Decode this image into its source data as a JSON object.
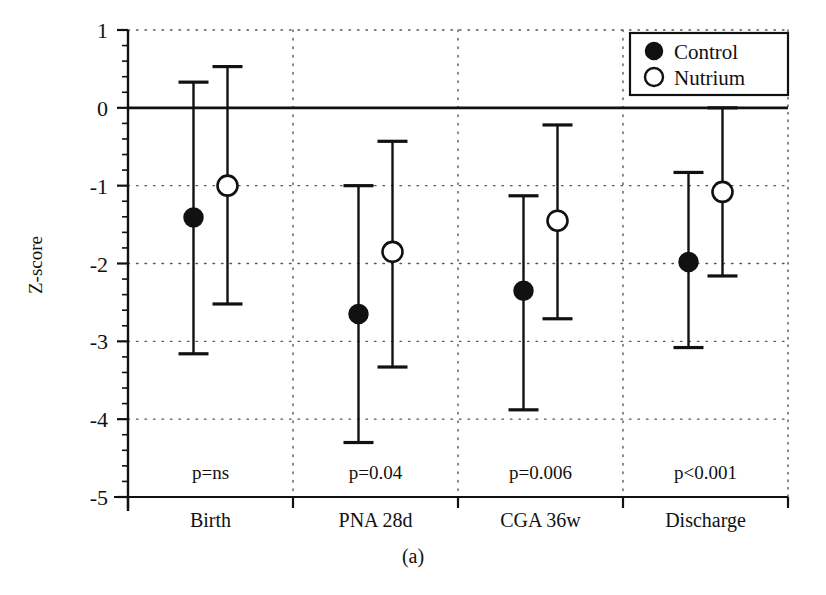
{
  "figure": {
    "caption": "(a)",
    "ylabel": "Z-score"
  },
  "legend": {
    "items": [
      {
        "label": "Control",
        "marker": "filled-circle-icon",
        "color": "#111111"
      },
      {
        "label": "Nutrium",
        "marker": "open-circle-icon",
        "color": "#111111"
      }
    ]
  },
  "axis": {
    "y_ticks": [
      "1",
      "0",
      "-1",
      "-2",
      "-3",
      "-4",
      "-5"
    ],
    "x_ticks": [
      "Birth",
      "PNA 28d",
      "CGA 36w",
      "Discharge"
    ]
  },
  "pvalues": [
    "p=ns",
    "p=0.04",
    "p=0.006",
    "p<0.001"
  ],
  "chart_data": {
    "type": "scatter",
    "title": "",
    "subtitle": "",
    "xlabel": "",
    "ylabel": "Z-score",
    "ylim": [
      -5,
      1
    ],
    "yticks": [
      1,
      0,
      -1,
      -2,
      -3,
      -4,
      -5
    ],
    "grid": true,
    "grid_style": "dotted",
    "legend_position": "top-right",
    "annotations": [
      "p=ns",
      "p=0.04",
      "p=0.006",
      "p<0.001",
      "(a)"
    ],
    "categories": [
      "Birth",
      "PNA 28d",
      "CGA 36w",
      "Discharge"
    ],
    "series": [
      {
        "name": "Control",
        "marker": "filled-circle",
        "values": [
          -1.41,
          -2.65,
          -2.35,
          -1.98
        ],
        "error_low": [
          -3.16,
          -4.3,
          -3.88,
          -3.08
        ],
        "error_high": [
          0.33,
          -1.0,
          -1.13,
          -0.83
        ]
      },
      {
        "name": "Nutrium",
        "marker": "open-circle",
        "values": [
          -1.0,
          -1.85,
          -1.45,
          -1.08
        ],
        "error_low": [
          -2.52,
          -3.33,
          -2.71,
          -2.16
        ],
        "error_high": [
          0.53,
          -0.43,
          -0.22,
          0.0
        ]
      }
    ]
  },
  "colors": {
    "ink": "#111111",
    "grid": "#555555",
    "background": "#ffffff"
  }
}
